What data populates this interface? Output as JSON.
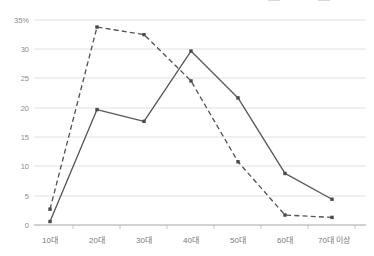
{
  "legend": {
    "position": "top-right",
    "clipped": true,
    "entries": [
      {
        "label": "",
        "style": "solid"
      },
      {
        "label": "",
        "style": "dashed"
      }
    ]
  },
  "axes": {
    "y_ticks": [
      "35%",
      "30",
      "25",
      "20",
      "15",
      "10",
      "5",
      "0"
    ],
    "x_ticks": [
      "10대",
      "20대",
      "30대",
      "40대",
      "50대",
      "60대",
      "70대 이상"
    ]
  },
  "colors": {
    "solid_series": "#595959",
    "dashed_series": "#555555",
    "gridline": "#d9d9d9",
    "axis": "#9a9a9a",
    "tick_text": "#7a7a7a",
    "background": "#ffffff"
  },
  "chart_data": {
    "type": "line",
    "title": "",
    "xlabel": "",
    "ylabel": "",
    "categories": [
      "10대",
      "20대",
      "30대",
      "40대",
      "50대",
      "60대",
      "70대 이상"
    ],
    "series": [
      {
        "name": "series-solid",
        "style": "solid",
        "values": [
          0.6,
          19.7,
          17.7,
          29.7,
          21.7,
          8.8,
          4.4
        ]
      },
      {
        "name": "series-dashed",
        "style": "dashed",
        "values": [
          2.7,
          33.8,
          32.5,
          24.6,
          10.8,
          1.7,
          1.3
        ]
      }
    ],
    "ylim": [
      0,
      35
    ],
    "y_tick_values": [
      35,
      30,
      25,
      20,
      15,
      10,
      5,
      0
    ],
    "grid": true,
    "legend_position": "top-right"
  }
}
